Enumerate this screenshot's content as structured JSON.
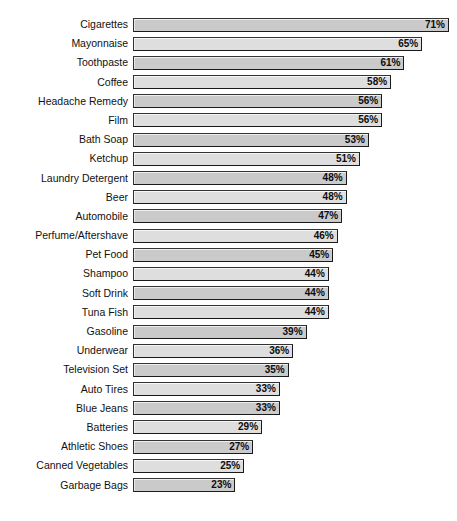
{
  "chart": {
    "title": "",
    "axis_left_label": "",
    "value_suffix": "%"
  },
  "chart_data": {
    "type": "bar",
    "orientation": "horizontal",
    "title": "",
    "subtitle": "",
    "xlabel": "",
    "ylabel": "",
    "xlim": [
      0,
      71
    ],
    "grid": false,
    "legend": null,
    "value_format": "{v}%",
    "categories": [
      "Cigarettes",
      "Mayonnaise",
      "Toothpaste",
      "Coffee",
      "Headache Remedy",
      "Film",
      "Bath Soap",
      "Ketchup",
      "Laundry Detergent",
      "Beer",
      "Automobile",
      "Perfume/Aftershave",
      "Pet Food",
      "Shampoo",
      "Soft Drink",
      "Tuna Fish",
      "Gasoline",
      "Underwear",
      "Television Set",
      "Auto Tires",
      "Blue Jeans",
      "Batteries",
      "Athletic Shoes",
      "Canned Vegetables",
      "Garbage Bags"
    ],
    "values": [
      71,
      65,
      61,
      58,
      56,
      56,
      53,
      51,
      48,
      48,
      47,
      46,
      45,
      44,
      44,
      44,
      39,
      36,
      35,
      33,
      33,
      29,
      27,
      25,
      23
    ],
    "value_labels": [
      "71%",
      "65%",
      "61%",
      "58%",
      "56%",
      "56%",
      "53%",
      "51%",
      "48%",
      "48%",
      "47%",
      "46%",
      "45%",
      "44%",
      "44%",
      "44%",
      "39%",
      "36%",
      "35%",
      "33%",
      "33%",
      "29%",
      "27%",
      "25%",
      "23%"
    ]
  },
  "colors": {
    "background": "#ffffff",
    "bar_fill_odd": "#cacaca",
    "bar_fill_even": "#dedede",
    "bar_border": "#333333",
    "label_text": "#111111",
    "value_text": "#0d0d0d"
  }
}
